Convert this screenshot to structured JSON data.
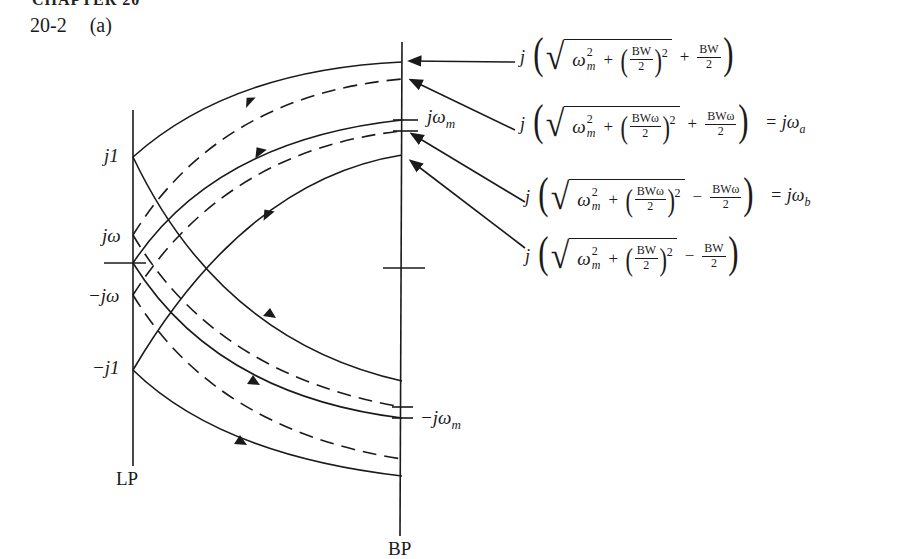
{
  "page": {
    "header_cut": "CHAPTER 20",
    "problem_number": "20-2",
    "part": "(a)"
  },
  "figure": {
    "lp_axis": {
      "label": "LP",
      "ticks": [
        {
          "label": "j1"
        },
        {
          "label": "jω"
        },
        {
          "label": ""
        },
        {
          "label": "−jω"
        },
        {
          "label": "−j1"
        }
      ]
    },
    "bp_axis": {
      "label": "BP",
      "ticks": [
        {
          "label": "jω",
          "sub": "m"
        },
        {
          "label": "−jω",
          "sub": "m"
        }
      ]
    },
    "equations": [
      {
        "prefix": "j",
        "omega": "ω",
        "sup": "2",
        "sub": "m",
        "plus": "+",
        "frac_num": "BW",
        "frac_den": "2",
        "pow": "2",
        "op": "+",
        "tail_num": "BW",
        "tail_den": "2",
        "result": ""
      },
      {
        "prefix": "j",
        "omega": "ω",
        "sup": "2",
        "sub": "m",
        "plus": "+",
        "frac_num": "BWω",
        "frac_den": "2",
        "pow": "2",
        "op": "+",
        "tail_num": "BWω",
        "tail_den": "2",
        "result": "= jω",
        "result_sub": "a"
      },
      {
        "prefix": "j",
        "omega": "ω",
        "sup": "2",
        "sub": "m",
        "plus": "+",
        "frac_num": "BWω",
        "frac_den": "2",
        "pow": "2",
        "op": "−",
        "tail_num": "BWω",
        "tail_den": "2",
        "result": "= jω",
        "result_sub": "b"
      },
      {
        "prefix": "j",
        "omega": "ω",
        "sup": "2",
        "sub": "m",
        "plus": "+",
        "frac_num": "BW",
        "frac_den": "2",
        "pow": "2",
        "op": "−",
        "tail_num": "BW",
        "tail_den": "2",
        "result": ""
      }
    ],
    "colors": {
      "ink": "#1a1a1a",
      "paper": "#ffffff"
    }
  }
}
